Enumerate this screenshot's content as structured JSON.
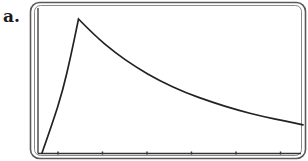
{
  "figure": {
    "part_label": "a."
  },
  "colors": {
    "frame_outer": "#5a5a5a",
    "frame_inner": "#7a7a7a",
    "axis": "#333333",
    "curve": "#222222",
    "background": "#ffffff"
  },
  "chart_data": {
    "type": "line",
    "title": "",
    "xlabel": "",
    "ylabel": "",
    "x_tick_count": 6,
    "x_tick_labels": [],
    "y_tick_labels": [],
    "grid": false,
    "legend": null,
    "xlim": [
      0,
      1
    ],
    "ylim": [
      0,
      1
    ],
    "series": [
      {
        "name": "f(x)",
        "x": [
          0.0,
          0.04,
          0.08,
          0.11,
          0.14,
          0.2,
          0.28,
          0.36,
          0.45,
          0.55,
          0.65,
          0.75,
          0.85,
          0.93,
          1.0
        ],
        "y": [
          0.0,
          0.22,
          0.47,
          0.72,
          1.0,
          0.88,
          0.75,
          0.64,
          0.54,
          0.45,
          0.38,
          0.32,
          0.27,
          0.24,
          0.21
        ]
      }
    ]
  }
}
